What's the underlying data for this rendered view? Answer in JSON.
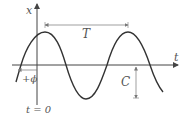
{
  "diagram": {
    "type": "sinusoid",
    "labels": {
      "x_axis": "x",
      "t_axis": "t",
      "period": "T",
      "phase": "+ϕ",
      "amplitude": "C",
      "origin": "t = 0"
    },
    "colors": {
      "curve": "#333333",
      "axes": "#444444",
      "annotation": "#666666",
      "text": "#555555"
    }
  }
}
